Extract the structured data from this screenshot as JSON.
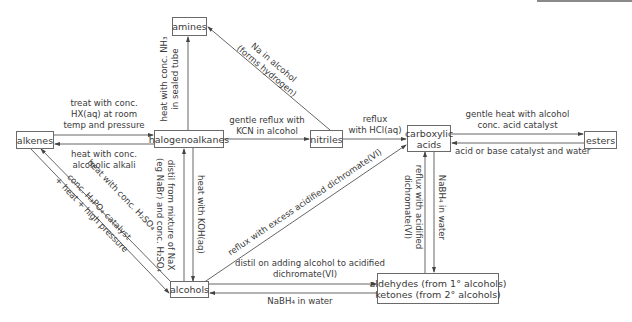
{
  "nodes": {
    "amines": "amines",
    "alkenes": "alkenes",
    "halogenoalkanes": "halogenoalkanes",
    "nitriles": "nitriles",
    "carboxylic_acids": [
      "carboxylic",
      "acids"
    ],
    "esters": "esters",
    "alcohols": "alcohols",
    "aldehydes_ketones": [
      "aldehydes (from 1° alcohols)",
      "ketones (from 2° alcohols)"
    ]
  },
  "edges": {
    "alkenes_to_halogenoalkanes": [
      "treat with conc.",
      "HX(aq) at room",
      "temp and pressure"
    ],
    "halogenoalkanes_to_alkenes": [
      "heat with conc.",
      "alcoholic alkali"
    ],
    "halogenoalkanes_to_amines": [
      "heat with conc. NH₃",
      "in sealed tube"
    ],
    "nitriles_to_amines": [
      "Na in alcohol",
      "(forms hydrogen)"
    ],
    "halogenoalkanes_to_nitriles": [
      "gentle reflux with",
      "KCN in alcohol"
    ],
    "nitriles_to_carboxylic_acids": [
      "reflux",
      "with HCl(aq)"
    ],
    "carboxylic_acids_to_esters": [
      "gentle heat with alcohol",
      "conc. acid catalyst"
    ],
    "esters_to_carboxylic_acids": "acid or base catalyst and water",
    "alcohols_to_halogenoalkanes": [
      "distil from mixture of NaX",
      "(eg NaBr) and conc. H₂SO₄"
    ],
    "halogenoalkanes_to_alcohols": "heat with KOH(aq)",
    "alkenes_to_alcohols": [
      "conc. H₃PO₄ catalyst",
      "+ heat + high pressure"
    ],
    "alcohols_to_alkenes": "heat with conc. H₂SO₄",
    "alcohols_to_carboxylic_acids": "reflux with excess acidified dichromate(VI)",
    "alcohols_to_aldehydes": [
      "distil on adding alcohol to acidified",
      "dichromate(VI)"
    ],
    "aldehydes_to_alcohols": "NaBH₄ in water",
    "aldehydes_to_carboxylic_acids": [
      "reflux with acidified",
      "dichromate(VI)"
    ],
    "carboxylic_acids_to_aldehydes": "NaBH₄ in water"
  },
  "colors": {
    "line": "#555555",
    "text": "#3a3a3a",
    "border": "#6a6a6a"
  }
}
